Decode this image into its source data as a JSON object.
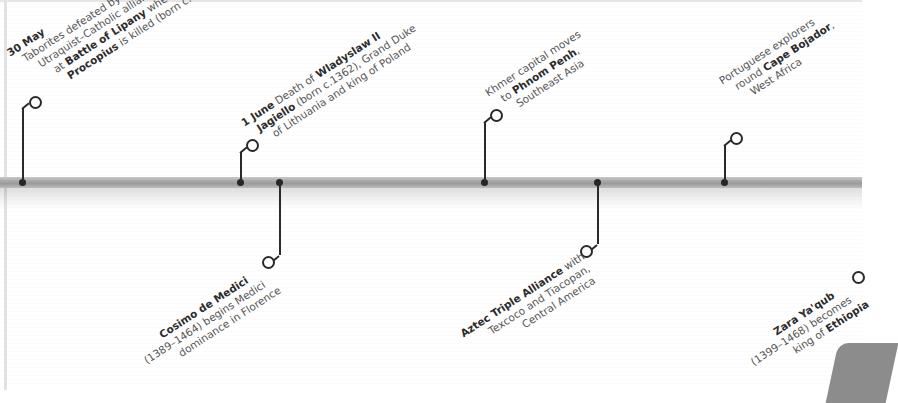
{
  "timeline": {
    "bar_color": "#a9a9a9",
    "marker_color": "#2a2a2a",
    "events_above": [
      {
        "id": "lipany",
        "date": "30 May",
        "lines": [
          [
            "30 May",
            ""
          ],
          [
            "",
            "Taborites defeated by"
          ],
          [
            "",
            "Utraquist–Catholic alliance"
          ],
          [
            "at ",
            "Battle of Lipany",
            " where"
          ],
          [
            "Procopius",
            " is killed (born c.1380)"
          ]
        ],
        "text_plain": "30 May Taborites defeated by Utraquist–Catholic alliance at Battle of Lipany where Procopius is killed (born c.1380)"
      },
      {
        "id": "jagiello",
        "date": "1 June",
        "text_plain": "1 June Death of Wladyslaw II Jagiello (born c.1362), Grand Duke of Lithuania and king of Poland"
      },
      {
        "id": "phnom-penh",
        "text_plain": "Khmer capital moves to Phnom Penh, Southeast Asia"
      },
      {
        "id": "cape-bojador",
        "text_plain": "Portuguese explorers round Cape Bojador, West Africa"
      }
    ],
    "events_below": [
      {
        "id": "medici",
        "text_plain": "Cosimo de Medici (1389–1464) begins Medici dominance in Florence"
      },
      {
        "id": "aztec",
        "text_plain": "Aztec Triple Alliance with Texcoco and Tiacopan, Central America"
      },
      {
        "id": "zara-yaqub",
        "text_plain": "Zara Ya'qub (1399–1468) becomes king of Ethiopia"
      }
    ]
  },
  "text": {
    "lipany": {
      "l1_bold": "30 May",
      "l2": "Taborites defeated by",
      "l3": "Utraquist–Catholic alliance",
      "l4_pre": "at ",
      "l4_bold": "Battle of Lipany",
      "l4_post": " where",
      "l5_bold": "Procopius",
      "l5_post": " is killed (born c.1380)"
    },
    "jagiello": {
      "l1_bold": "1 June",
      "l1_mid": " Death of ",
      "l1_bold2": "Wladyslaw II",
      "l2_bold": "Jagiello",
      "l2_post": " (born c.1362), Grand Duke",
      "l3": "of Lithuania and king of Poland"
    },
    "phnom": {
      "l1": "Khmer capital moves",
      "l2_pre": "to ",
      "l2_bold": "Phnom Penh",
      "l2_post": ",",
      "l3": "Southeast Asia"
    },
    "bojador": {
      "l1": "Portuguese explorers",
      "l2_pre": "round ",
      "l2_bold": "Cape Bojador",
      "l2_post": ",",
      "l3": "West Africa"
    },
    "medici": {
      "l1_bold": "Cosimo de Medici",
      "l2": "(1389–1464) begins Medici",
      "l3": "dominance in Florence"
    },
    "aztec": {
      "l1_bold": "Aztec Triple Alliance",
      "l1_post": " with",
      "l2": "Texcoco and Tiacopan,",
      "l3": "Central America"
    },
    "zara": {
      "l1_bold": "Zara Ya'qub",
      "l2": "(1399–1468) becomes",
      "l3_pre": "king of ",
      "l3_bold": "Ethiopia"
    }
  }
}
